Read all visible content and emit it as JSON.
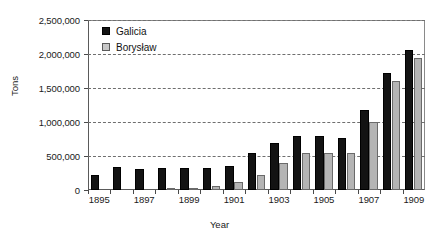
{
  "chart_data": {
    "type": "bar",
    "title": "",
    "xlabel": "Year",
    "ylabel": "Tons",
    "ylim": [
      0,
      2500000
    ],
    "ytick_labels": [
      "0",
      "500,000",
      "1,000,000",
      "1,500,000",
      "2,000,000",
      "2,500,000"
    ],
    "ytick_values": [
      0,
      500000,
      1000000,
      1500000,
      2000000,
      2500000
    ],
    "grid": true,
    "legend_position": "top-left",
    "categories": [
      "1895",
      "1896",
      "1897",
      "1898",
      "1899",
      "1900",
      "1901",
      "1902",
      "1903",
      "1904",
      "1905",
      "1906",
      "1907",
      "1908",
      "1909"
    ],
    "xtick_labels": [
      "1895",
      "1897",
      "1899",
      "1901",
      "1903",
      "1905",
      "1907",
      "1909"
    ],
    "series": [
      {
        "name": "Galicia",
        "color": "#131313",
        "values": [
          215000,
          340000,
          315000,
          330000,
          320000,
          325000,
          350000,
          550000,
          690000,
          800000,
          790000,
          765000,
          1180000,
          1725000,
          2060000
        ]
      },
      {
        "name": "Borysław",
        "color": "#b4b4b4",
        "values": [
          0,
          0,
          0,
          8000,
          10000,
          55000,
          115000,
          215000,
          400000,
          540000,
          545000,
          540000,
          995000,
          1610000,
          1945000
        ]
      }
    ]
  },
  "legend": {
    "items": [
      {
        "label": "Galicia",
        "swatch": "galicia"
      },
      {
        "label": "Borysław",
        "swatch": "boryslaw"
      }
    ]
  },
  "axes": {
    "y_title": "Tons",
    "x_title": "Year"
  }
}
